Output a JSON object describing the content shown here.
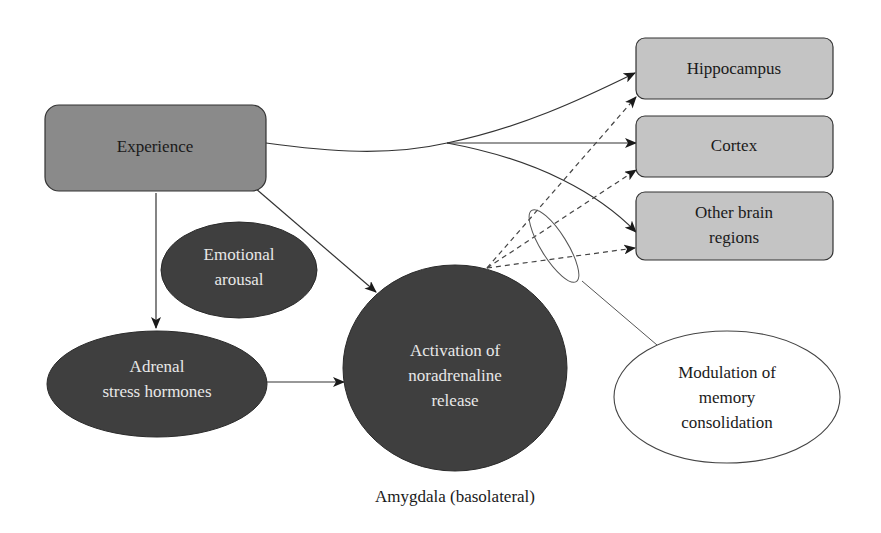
{
  "diagram": {
    "type": "flow-diagram",
    "colors": {
      "experience_fill": "#8a8a8a",
      "region_fill": "#c4c4c4",
      "dark_node_fill": "#3f3f3f",
      "outline": "#333333",
      "modulation_fill": "#ffffff"
    },
    "nodes": {
      "experience": {
        "label": "Experience",
        "shape": "rounded-rect"
      },
      "hippocampus": {
        "label": "Hippocampus",
        "shape": "rounded-rect"
      },
      "cortex": {
        "label": "Cortex",
        "shape": "rounded-rect"
      },
      "other_regions": {
        "line1": "Other brain",
        "line2": "regions",
        "shape": "rounded-rect"
      },
      "emotional_arousal": {
        "line1": "Emotional",
        "line2": "arousal",
        "shape": "ellipse"
      },
      "adrenal": {
        "line1": "Adrenal",
        "line2": "stress hormones",
        "shape": "ellipse"
      },
      "noradrenaline": {
        "line1": "Activation of",
        "line2": "noradrenaline",
        "line3": "release",
        "shape": "circle"
      },
      "modulation": {
        "line1": "Modulation of",
        "line2": "memory",
        "line3": "consolidation",
        "shape": "ellipse"
      }
    },
    "caption": "Amygdala (basolateral)",
    "edges": [
      {
        "from": "experience",
        "to": "hippocampus",
        "style": "solid"
      },
      {
        "from": "experience",
        "to": "cortex",
        "style": "solid"
      },
      {
        "from": "experience",
        "to": "other_regions",
        "style": "solid"
      },
      {
        "from": "experience",
        "to": "adrenal",
        "style": "solid"
      },
      {
        "from": "experience",
        "to": "noradrenaline",
        "style": "solid"
      },
      {
        "from": "adrenal",
        "to": "noradrenaline",
        "style": "solid"
      },
      {
        "from": "noradrenaline",
        "to": "hippocampus",
        "style": "dashed"
      },
      {
        "from": "noradrenaline",
        "to": "cortex",
        "style": "dashed"
      },
      {
        "from": "noradrenaline",
        "to": "other_regions",
        "style": "dashed"
      },
      {
        "from": "modulation",
        "to": "dashed-bundle",
        "style": "thin-line"
      }
    ]
  }
}
